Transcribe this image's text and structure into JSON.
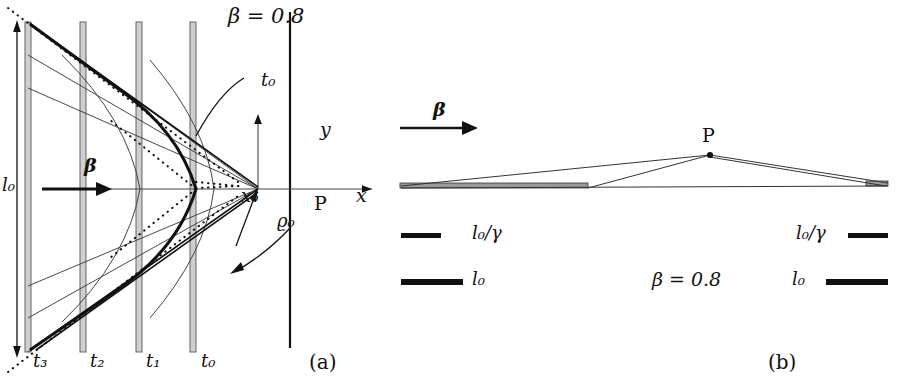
{
  "figure": {
    "caption_a": "(a)",
    "caption_b": "(b)"
  },
  "panel_a": {
    "beta_label": "β = 0.8",
    "axis_x_label": "x",
    "axis_y_label": "y",
    "point_label": "P",
    "x0_label": "x₀",
    "rho0_label": "ϱ₀",
    "l0_label": "l₀",
    "beta_arrow_label": "β",
    "t0_callout": "t₀",
    "time_ticks": [
      {
        "name": "t3",
        "label": "t₃",
        "x": 42
      },
      {
        "name": "t2",
        "label": "t₂",
        "x": 99
      },
      {
        "name": "t1",
        "label": "t₁",
        "x": 155
      },
      {
        "name": "t0",
        "label": "t₀",
        "x": 210
      }
    ],
    "rod_x_positions": [
      28,
      83,
      139,
      193
    ],
    "rod_top_y": 22,
    "rod_bottom_y": 352,
    "observer_axis_x": 290,
    "axis_origin": {
      "x": 258,
      "y": 189
    }
  },
  "panel_b": {
    "beta_arrow_label": "β",
    "point_label": "P",
    "beta_value_label": "β = 0.8",
    "legend_left": [
      {
        "name": "contracted-length",
        "label": "l₀/γ",
        "bar_length": 40,
        "bar_thickness": 5
      },
      {
        "name": "proper-length",
        "label": "l₀",
        "bar_length": 62,
        "bar_thickness": 6
      }
    ],
    "legend_right": [
      {
        "name": "contracted-length",
        "label": "l₀/γ",
        "bar_length": 40,
        "bar_thickness": 5
      },
      {
        "name": "proper-length",
        "label": "l₀",
        "bar_length": 62,
        "bar_thickness": 6
      }
    ],
    "observer_point": {
      "x": 710,
      "y": 155
    }
  },
  "colors": {
    "ink": "#111111",
    "thin_line": "#444444",
    "rod_fill": "#cccccc",
    "rod_stroke": "#555555"
  }
}
